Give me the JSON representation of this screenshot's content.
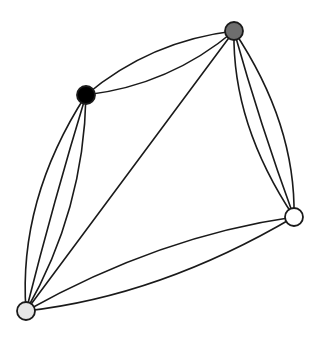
{
  "graph": {
    "type": "multigraph",
    "edge_color": "#1a1a1a",
    "nodes": [
      {
        "id": "A",
        "name": "node-black",
        "x": 86,
        "y": 95,
        "r": 9,
        "fill": "#000000"
      },
      {
        "id": "B",
        "name": "node-dark-gray",
        "x": 234,
        "y": 31,
        "r": 9,
        "fill": "#6e6e6e"
      },
      {
        "id": "C",
        "name": "node-white",
        "x": 294,
        "y": 217,
        "r": 9,
        "fill": "#ffffff"
      },
      {
        "id": "D",
        "name": "node-light-gray",
        "x": 26,
        "y": 311,
        "r": 9,
        "fill": "#e6e6e6"
      }
    ],
    "edges": [
      {
        "from": "A",
        "to": "B",
        "cx": 150,
        "cy": 41
      },
      {
        "from": "A",
        "to": "B",
        "cx": 170,
        "cy": 85
      },
      {
        "from": "A",
        "to": "D",
        "cx": 18,
        "cy": 200
      },
      {
        "from": "A",
        "to": "D",
        "cx": 54,
        "cy": 200
      },
      {
        "from": "A",
        "to": "D",
        "cx": 84,
        "cy": 210
      },
      {
        "from": "B",
        "to": "C",
        "cx": 232,
        "cy": 124
      },
      {
        "from": "B",
        "to": "C",
        "cx": 260,
        "cy": 124
      },
      {
        "from": "B",
        "to": "C",
        "cx": 296,
        "cy": 124
      },
      {
        "from": "D",
        "to": "C",
        "cx": 160,
        "cy": 236
      },
      {
        "from": "D",
        "to": "C",
        "cx": 160,
        "cy": 296
      },
      {
        "from": "D",
        "to": "B",
        "cx": 130,
        "cy": 171
      }
    ]
  }
}
